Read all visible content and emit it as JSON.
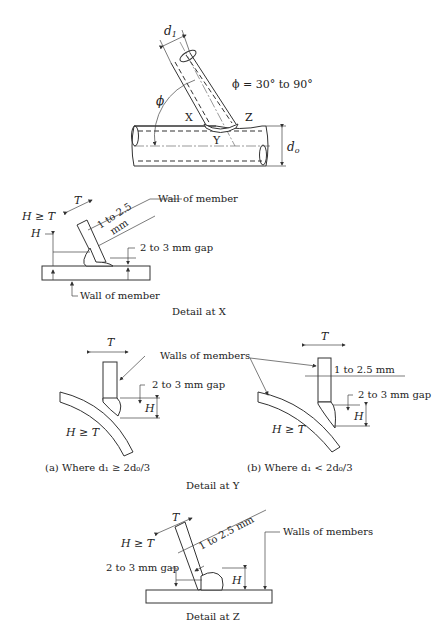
{
  "overview": {
    "d1_label": "d",
    "d1_sub": "1",
    "d0_label": "d",
    "d0_sub": "o",
    "phi_symbol": "ϕ",
    "phi_range": "ϕ = 30° to 90°",
    "point_x": "X",
    "point_y": "Y",
    "point_z": "Z"
  },
  "detail_x": {
    "h_ge_t": "H ≥ T",
    "t_label": "T",
    "h_label": "H",
    "wall_top": "Wall of member",
    "clearance_line1": "1 to 2.5",
    "clearance_line2": "mm",
    "gap": "2 to 3 mm gap",
    "wall_bottom": "Wall of member",
    "caption": "Detail at X"
  },
  "detail_y": {
    "a": {
      "t_label": "T",
      "h_label": "H",
      "h_ge_t": "H ≥ T",
      "gap": "2 to 3 mm gap",
      "caption": "(a) Where d₁ ≥ 2d₀/3"
    },
    "b": {
      "t_label": "T",
      "h_label": "H",
      "h_ge_t": "H ≥ T",
      "clearance": "1 to 2.5 mm",
      "gap": "2 to 3 mm gap",
      "caption": "(b) Where d₁ < 2d₀/3"
    },
    "walls": "Walls of members",
    "caption": "Detail at Y"
  },
  "detail_z": {
    "t_label": "T",
    "h_label": "H",
    "h_ge_t": "H ≥ T",
    "clearance": "1 to 2.5 mm",
    "walls": "Walls of members",
    "gap": "2 to 3 mm gap",
    "caption": "Detail at Z"
  }
}
